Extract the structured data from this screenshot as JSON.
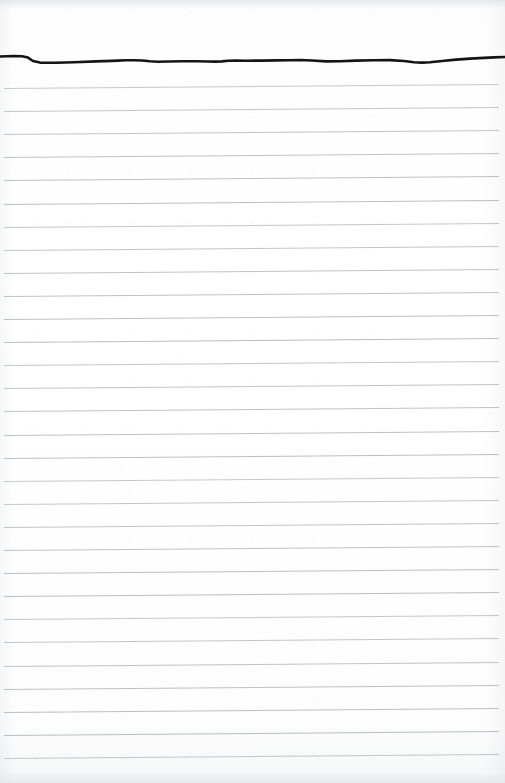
{
  "document": {
    "kind": "scanned-ruled-notepad-page",
    "title": "Blank ruled notepad page",
    "page_width": 505,
    "page_height": 783,
    "has_visible_text": false,
    "visible_text": "",
    "colors": {
      "paper": "#fdfdfd",
      "rule_line": "#b6babe",
      "ink_edge": "#141414",
      "scan_edge_shadow": "#dadde1"
    }
  },
  "ink_edge": {
    "name": "hand-drawn-ink-line",
    "stroke_color": "#141414",
    "stroke_width": 2.6,
    "top_offset": 40,
    "path": "M 0,16.5 L 14,16.0 L 22,16.2 L 28,17.6 L 33,21.0 L 40,22.6 L 56,22.8 L 74,22.2 L 96,21.4 L 112,20.9 L 118,20.6 L 126,20.3 L 134,20.2 L 142,20.5 L 150,21.3 L 158,21.8 L 168,21.5 L 182,21.2 L 196,21.3 L 208,21.5 L 215,21.6 L 222,21.4 L 228,20.8 L 236,20.6 L 246,20.7 L 262,20.6 L 276,20.4 L 288,20.3 L 300,20.0 L 312,20.5 L 326,21.4 L 340,21.3 L 356,20.6 L 374,20.2 L 390,20.1 L 404,21.0 L 414,22.2 L 422,22.6 L 430,22.2 L 442,21.0 L 456,19.6 L 470,18.6 L 484,17.9 L 494,17.4 L 505,17.0"
  },
  "rules": {
    "name": "ruled-lines",
    "count": 30,
    "spacing": 23.1,
    "first_line_y": 88,
    "left_inset": 4,
    "right_inset": 6,
    "tilt_px": -4,
    "color": "#b6babe",
    "thickness": 1
  }
}
